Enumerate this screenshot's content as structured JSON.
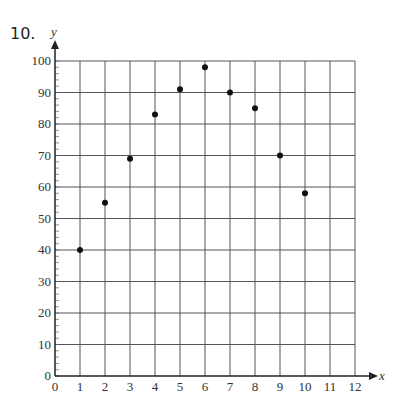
{
  "problem": {
    "number": "10."
  },
  "chart_data": {
    "type": "scatter",
    "title": "",
    "xlabel": "x",
    "ylabel": "y",
    "x": [
      1,
      2,
      3,
      4,
      5,
      6,
      7,
      8,
      9,
      10
    ],
    "values": [
      40,
      55,
      69,
      83,
      91,
      98,
      90,
      85,
      70,
      58
    ],
    "xlim": [
      0,
      12
    ],
    "ylim": [
      0,
      100
    ],
    "x_ticks": [
      0,
      1,
      2,
      3,
      4,
      5,
      6,
      7,
      8,
      9,
      10,
      11,
      12
    ],
    "y_ticks": [
      0,
      10,
      20,
      30,
      40,
      50,
      60,
      70,
      80,
      90,
      100
    ],
    "x_minor_ticks": false,
    "y_minor_tick_step": 2,
    "grid": true,
    "legend": null,
    "colors": {
      "points": "#111111",
      "grid": "#555555",
      "axis": "#222222"
    }
  }
}
